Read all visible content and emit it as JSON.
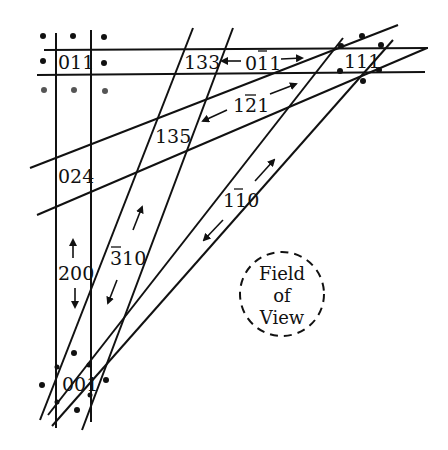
{
  "diagram": {
    "type": "Kikuchi map",
    "poles": [
      {
        "id": "pole-001",
        "label": "001"
      },
      {
        "id": "pole-011",
        "label": "011"
      },
      {
        "id": "pole-111",
        "label": "111"
      },
      {
        "id": "pole-133",
        "label": "133"
      },
      {
        "id": "pole-135",
        "label": "135"
      },
      {
        "id": "pole-024",
        "label": "024"
      }
    ],
    "bands": [
      {
        "id": "band-200",
        "label": "200",
        "overbar": ""
      },
      {
        "id": "band-0-11",
        "label": "011",
        "overbar": "middle 1 (0Ā1 → 0 1̄ 1)"
      },
      {
        "id": "band-1-21",
        "label": "121",
        "overbar": "2"
      },
      {
        "id": "band-1-10",
        "label": "110",
        "overbar": "second 1"
      },
      {
        "id": "band--310",
        "label": "310",
        "overbar": "3"
      }
    ],
    "field_of_view": {
      "lines": [
        "Field",
        "of",
        "View"
      ]
    }
  },
  "text": {
    "l011": "011",
    "l133": "133",
    "l135": "135",
    "l024": "024",
    "l200": "200",
    "l001": "001",
    "l111": "111",
    "b0_a": "0",
    "b0_b": "1",
    "b0_c": "1",
    "b1_a": "1",
    "b1_b": "2",
    "b1_c": "1",
    "b2_a": "1",
    "b2_b": "1",
    "b2_c": "0",
    "b3_a": "3",
    "b3_b": "10",
    "fov1": "Field",
    "fov2": "of",
    "fov3": "View"
  }
}
